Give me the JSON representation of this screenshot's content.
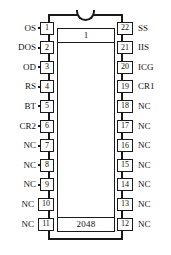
{
  "diagram": {
    "type": "dip-package-pinout",
    "package": "DIP-22",
    "body_marking_top": "1",
    "body_marking_bottom": "2048",
    "notch_icon": "package-notch-icon"
  },
  "pins": {
    "left_column": [
      {
        "number": "1",
        "label": "OS"
      },
      {
        "number": "2",
        "label": "DOS"
      },
      {
        "number": "3",
        "label": "OD"
      },
      {
        "number": "4",
        "label": "RS"
      },
      {
        "number": "5",
        "label": "BT"
      },
      {
        "number": "6",
        "label": "CR2"
      },
      {
        "number": "7",
        "label": "NC"
      },
      {
        "number": "8",
        "label": "NC"
      },
      {
        "number": "9",
        "label": "NC"
      },
      {
        "number": "10",
        "label": "NC"
      },
      {
        "number": "11",
        "label": "NC"
      }
    ],
    "right_column": [
      {
        "number": "22",
        "label": "SS"
      },
      {
        "number": "21",
        "label": "IIS"
      },
      {
        "number": "20",
        "label": "ICG"
      },
      {
        "number": "19",
        "label": "CR1"
      },
      {
        "number": "18",
        "label": "NC"
      },
      {
        "number": "17",
        "label": "NC"
      },
      {
        "number": "16",
        "label": "NC"
      },
      {
        "number": "15",
        "label": "NC"
      },
      {
        "number": "14",
        "label": "NC"
      },
      {
        "number": "13",
        "label": "NC"
      },
      {
        "number": "12",
        "label": "NC"
      }
    ]
  },
  "colors": {
    "background": "#ffffff",
    "outline": "#1a1a1a",
    "text": "#111111"
  }
}
